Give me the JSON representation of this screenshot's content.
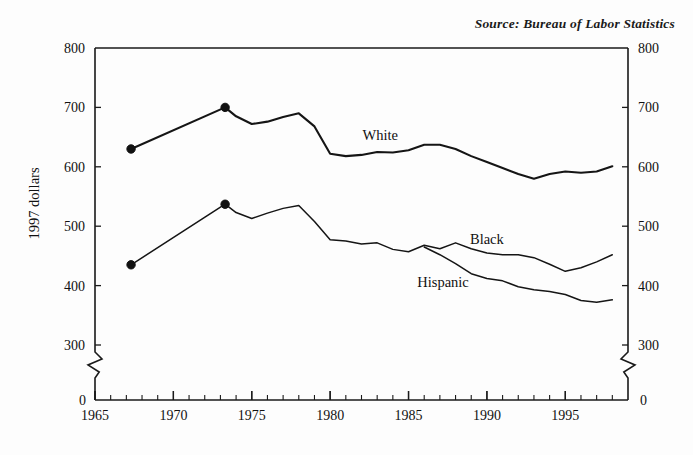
{
  "source_note": "Source:  Bureau of Labor Statistics",
  "axis": {
    "ylabel": "1997 dollars",
    "y_ticks": [
      "800",
      "700",
      "600",
      "500",
      "400",
      "300"
    ],
    "y_zero": "0",
    "x_ticks": [
      "1965",
      "1970",
      "1975",
      "1980",
      "1985",
      "1990",
      "1995"
    ],
    "break_symbol": "axis-break"
  },
  "labels": {
    "white": "White",
    "black": "Black",
    "hispanic": "Hispanic"
  },
  "colors": {
    "line": "#151515",
    "axis": "#1a1a1a",
    "background": "#fdfdfd"
  },
  "chart_data": {
    "type": "line",
    "title": "",
    "subtitle": "",
    "xlabel": "",
    "ylabel": "1997 dollars",
    "xlim": [
      1965,
      1999
    ],
    "ylim": [
      300,
      800
    ],
    "y_axis_break": true,
    "y_break_to": 0,
    "grid": false,
    "legend": "inline-labels",
    "x_tick_labels": [
      "1965",
      "1970",
      "1975",
      "1980",
      "1985",
      "1990",
      "1995"
    ],
    "x_tick_values": [
      1965,
      1970,
      1975,
      1980,
      1985,
      1990,
      1995
    ],
    "x_minor_tick_interval": 1,
    "y_tick_labels": [
      "300",
      "400",
      "500",
      "600",
      "700",
      "800"
    ],
    "y_tick_values": [
      300,
      400,
      500,
      600,
      700,
      800
    ],
    "series": [
      {
        "name": "White",
        "marker_points": [
          {
            "x": 1967.3,
            "y": 630
          },
          {
            "x": 1973.3,
            "y": 700
          }
        ],
        "x": [
          1967.3,
          1973.3,
          1974,
          1975,
          1976,
          1977,
          1978,
          1979,
          1980,
          1981,
          1982,
          1983,
          1984,
          1985,
          1986,
          1987,
          1988,
          1989,
          1990,
          1991,
          1992,
          1993,
          1994,
          1995,
          1996,
          1997,
          1998
        ],
        "values": [
          630,
          700,
          685,
          672,
          676,
          684,
          690,
          668,
          622,
          618,
          620,
          625,
          624,
          628,
          637,
          637,
          630,
          618,
          608,
          598,
          588,
          580,
          588,
          592,
          590,
          592,
          601
        ]
      },
      {
        "name": "Black",
        "marker_points": [
          {
            "x": 1967.3,
            "y": 435
          },
          {
            "x": 1973.3,
            "y": 537
          }
        ],
        "x": [
          1967.3,
          1973.3,
          1974,
          1975,
          1976,
          1977,
          1978,
          1979,
          1980,
          1981,
          1982,
          1983,
          1984,
          1985,
          1986,
          1987,
          1988,
          1989,
          1990,
          1991,
          1992,
          1993,
          1994,
          1995,
          1996,
          1997,
          1998
        ],
        "values": [
          435,
          537,
          523,
          513,
          522,
          530,
          535,
          508,
          477,
          475,
          470,
          472,
          461,
          457,
          468,
          462,
          472,
          462,
          455,
          452,
          452,
          447,
          436,
          424,
          430,
          440,
          452
        ]
      },
      {
        "name": "Hispanic",
        "marker_points": [],
        "x": [
          1986,
          1987,
          1988,
          1989,
          1990,
          1991,
          1992,
          1993,
          1994,
          1995,
          1996,
          1997,
          1998
        ],
        "values": [
          465,
          452,
          437,
          420,
          412,
          408,
          398,
          393,
          390,
          385,
          375,
          372,
          376
        ]
      }
    ],
    "annotations": [
      {
        "text": "White",
        "x": 1983.2,
        "y": 645
      },
      {
        "text": "Black",
        "x": 1990.0,
        "y": 470
      },
      {
        "text": "Hispanic",
        "x": 1987.2,
        "y": 398
      }
    ]
  }
}
